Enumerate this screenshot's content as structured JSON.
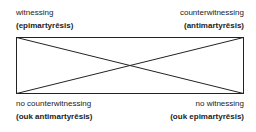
{
  "diagram": {
    "type": "square of opposition",
    "corners": {
      "top_left": {
        "term": "witnessing",
        "greek": "(epimartyrēsis)"
      },
      "top_right": {
        "term": "counterwitnessing",
        "greek": "(antimartyrēsis)"
      },
      "bottom_left": {
        "term": "no counterwitnessing",
        "greek": "(ouk antimartyrēsis)"
      },
      "bottom_right": {
        "term": "no witnessing",
        "greek": "(ouk epimartyrēsis)"
      }
    },
    "line_color": "#222222"
  }
}
